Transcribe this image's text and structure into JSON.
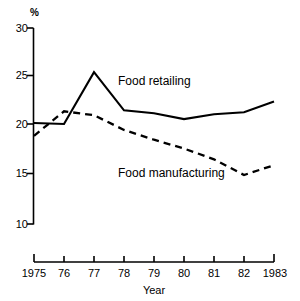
{
  "chart_data": {
    "type": "line",
    "title": "",
    "subtitle": "",
    "xlabel": "Year",
    "ylabel": "%",
    "x": [
      1975,
      1976,
      1977,
      1978,
      1979,
      1980,
      1981,
      1982,
      1983
    ],
    "categories": [
      "1975",
      "76",
      "77",
      "78",
      "79",
      "80",
      "81",
      "82",
      "1983"
    ],
    "xtick_labels": [
      "1975",
      "76",
      "77",
      "78",
      "79",
      "80",
      "81",
      "82",
      "1983"
    ],
    "ytick_labels": [
      "30",
      "25",
      "20",
      "15",
      "10"
    ],
    "ytick_values": [
      30,
      25,
      20,
      15,
      10
    ],
    "ylim": [
      10,
      30
    ],
    "xlim": [
      1975,
      1983
    ],
    "grid": false,
    "legend_position": "inline-annotation",
    "series": [
      {
        "name": "Food retailing",
        "style": "solid",
        "color": "#000000",
        "values": [
          20.3,
          20.2,
          25.5,
          21.6,
          21.3,
          20.7,
          21.2,
          21.4,
          22.5
        ]
      },
      {
        "name": "Food manufacturing",
        "style": "dashed",
        "color": "#000000",
        "values": [
          19.0,
          21.5,
          21.1,
          19.6,
          18.6,
          17.7,
          16.6,
          15.0,
          16.0
        ]
      }
    ],
    "annotations": [
      {
        "text": "Food retailing",
        "x": 1977.9,
        "y": 24.0
      },
      {
        "text": "Food manufacturing",
        "x": 1977.9,
        "y": 15.9
      }
    ]
  },
  "axes": {
    "y_unit": "%",
    "x_title": "Year"
  }
}
